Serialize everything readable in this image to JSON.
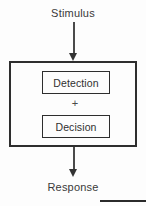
{
  "diagram": {
    "input_label": "Stimulus",
    "output_label": "Response",
    "operator": "+",
    "stages": [
      {
        "label": "Detection"
      },
      {
        "label": "Decision"
      }
    ],
    "arrows": [
      {
        "name": "stimulus-to-process",
        "direction": "down"
      },
      {
        "name": "process-to-response",
        "direction": "down"
      }
    ],
    "colors": {
      "background": "#fdfdfd",
      "stroke": "#2e2e2e",
      "text": "#303030",
      "arrow": "#333333"
    }
  }
}
